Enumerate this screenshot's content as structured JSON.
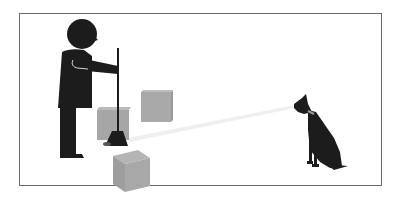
{
  "scene": {
    "description": "Pictogram: person holding a broom among boxes, light beam pointing toward a sitting dog",
    "colors": {
      "figure": "#1c1c1c",
      "box_front": "#a8a8a8",
      "box_side": "#999999",
      "box_top": "#b8b8b8",
      "beam": "#eeeeee",
      "frame": "#6a6a6a",
      "collar": "#9a9a9a"
    },
    "elements": [
      "person-silhouette",
      "broom",
      "box",
      "box",
      "box",
      "light-beam",
      "dog-silhouette"
    ]
  }
}
